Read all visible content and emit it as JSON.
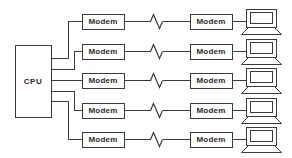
{
  "diagram": {
    "type": "network-topology",
    "canvas": {
      "width": 292,
      "height": 158
    },
    "stroke_color": "#3a3a3a",
    "fill_color": "#ffffff",
    "text_color": "#2b2b2b",
    "cpu": {
      "label": "CPU",
      "x": 15,
      "y": 45,
      "width": 36,
      "height": 72,
      "port_ys": [
        58,
        69,
        80,
        91,
        101
      ]
    },
    "columns": {
      "local_modem": {
        "x": 82,
        "width": 42,
        "height": 15
      },
      "remote_modem": {
        "x": 190,
        "width": 42,
        "height": 15
      },
      "terminal": {
        "x": 244,
        "width": 34,
        "height": 28
      }
    },
    "break_symbol": {
      "name": "line-break-zigzag",
      "center_x": 156,
      "amplitude": 7,
      "half_width": 6
    },
    "rows": [
      {
        "id": "row-1",
        "center_y": 21,
        "local_modem_label": "Modem",
        "remote_modem_label": "Modem",
        "terminal_label": "terminal",
        "cpu_port_y": 58,
        "riser_x": 68
      },
      {
        "id": "row-2",
        "center_y": 51,
        "local_modem_label": "Modem",
        "remote_modem_label": "Modem",
        "terminal_label": "terminal",
        "cpu_port_y": 69,
        "riser_x": 74
      },
      {
        "id": "row-3",
        "center_y": 80,
        "local_modem_label": "Modem",
        "remote_modem_label": "Modem",
        "terminal_label": "terminal",
        "cpu_port_y": 80,
        "riser_x": 68
      },
      {
        "id": "row-4",
        "center_y": 110,
        "local_modem_label": "Modem",
        "remote_modem_label": "Modem",
        "terminal_label": "terminal",
        "cpu_port_y": 91,
        "riser_x": 74
      },
      {
        "id": "row-5",
        "center_y": 139,
        "local_modem_label": "Modem",
        "remote_modem_label": "Modem",
        "terminal_label": "terminal",
        "cpu_port_y": 101,
        "riser_x": 68
      }
    ]
  }
}
